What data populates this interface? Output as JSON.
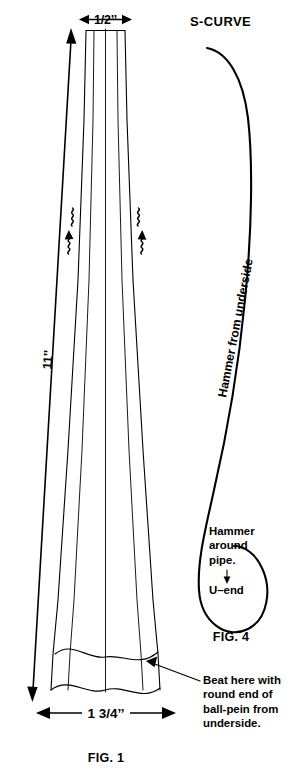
{
  "figure": {
    "title_fig1": "FIG. 1",
    "title_fig4": "FIG. 4",
    "scurve_label": "S-CURVE",
    "dimensions": {
      "top_width": "1/2’’",
      "length": "11’’",
      "bottom_width": "1 3/4’’"
    },
    "annotations": {
      "hammer_underside": "Hammer from underside",
      "hammer_pipe": "Hammer\naround\npipe.",
      "u_end": "U–end",
      "beat_here": "Beat here with\nround end of\nball-pein from\nunderside.",
      "down_arrow_glyph": "↓"
    },
    "colors": {
      "ink": "#000000",
      "background": "#ffffff"
    }
  }
}
